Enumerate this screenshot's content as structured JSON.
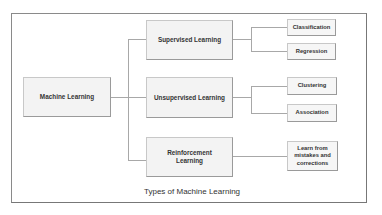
{
  "diagram": {
    "caption": "Types of Machine Learning",
    "root": {
      "label": "Machine Learning"
    },
    "categories": [
      {
        "label": "Supervised Learning",
        "children": [
          "Classification",
          "Regression"
        ]
      },
      {
        "label": "Unsupervised Learning",
        "children": [
          "Clustering",
          "Association"
        ]
      },
      {
        "label": "Reinforcement Learning",
        "children": [
          "Learn from mistakes and corrections"
        ]
      }
    ]
  }
}
